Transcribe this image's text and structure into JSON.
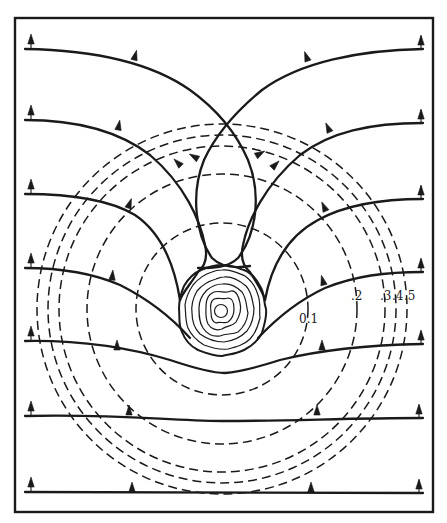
{
  "figure": {
    "type": "field-line-diagram",
    "stroke_color": "#1a1a1a",
    "background": "#ffffff"
  },
  "frame": {
    "x": 15,
    "y": 18,
    "width": 418,
    "height": 494
  },
  "center": {
    "x": 222,
    "y": 309
  },
  "dashed_circles": [
    {
      "label": "0.1",
      "radius": 86,
      "label_x": 299,
      "label_y": 322
    },
    {
      "label": ".2",
      "radius": 135,
      "label_x": 352,
      "label_y": 301
    },
    {
      "label": ".3",
      "radius": 163,
      "label_x": 381,
      "label_y": 301
    },
    {
      "label": ".4",
      "radius": 174,
      "label_x": 394,
      "label_y": 301
    },
    {
      "label": ".5",
      "radius": 185,
      "label_x": 405,
      "label_y": 301
    }
  ],
  "labels": {
    "c01": "0.1",
    "c02": ".2",
    "c03": ".3",
    "c04": ".4",
    "c05": ".5"
  },
  "body": {
    "cx": 222,
    "cy": 310,
    "rx": 43,
    "ry": 45,
    "contour_count": 7
  },
  "field_lines": [
    {
      "id": "line-1",
      "left_start_y": 49,
      "note": "crosses at top (226,124), loops into body"
    },
    {
      "id": "line-2",
      "left_start_y": 120,
      "note": "inner teardrop loop to body"
    },
    {
      "id": "line-3",
      "left_start_y": 194,
      "note": "bends down to body side"
    },
    {
      "id": "line-4",
      "left_start_y": 268,
      "note": "bends down to body lower side"
    },
    {
      "id": "line-5",
      "left_start_y": 341,
      "note": "dips under body"
    },
    {
      "id": "line-6",
      "left_start_y": 416,
      "note": "near-straight"
    },
    {
      "id": "line-7",
      "left_start_y": 492,
      "note": "straight baseline"
    }
  ]
}
